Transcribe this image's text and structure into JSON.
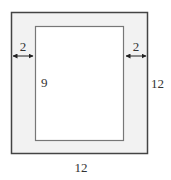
{
  "diagram": {
    "outer_rect": {
      "width_label": "12",
      "height_label": "12",
      "fill": "#f2f2f2",
      "stroke": "#444444"
    },
    "inner_rect": {
      "height_label": "9",
      "fill": "#ffffff",
      "stroke": "#777777"
    },
    "left_margin": {
      "label": "2"
    },
    "right_margin": {
      "label": "2"
    }
  }
}
